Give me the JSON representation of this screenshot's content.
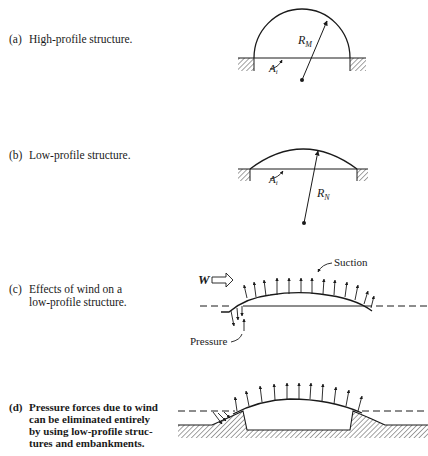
{
  "panels": [
    {
      "id": "a",
      "label": "(a)",
      "caption_lines": [
        "High-profile structure."
      ],
      "radius_label": "R",
      "radius_sub": "M",
      "area_label": "A",
      "area_sub": "i"
    },
    {
      "id": "b",
      "label": "(b)",
      "caption_lines": [
        "Low-profile structure."
      ],
      "radius_label": "R",
      "radius_sub": "N",
      "area_label": "A",
      "area_sub": "i"
    },
    {
      "id": "c",
      "label": "(c)",
      "caption_lines": [
        "Effects of wind on a",
        "low-profile structure."
      ],
      "wind_label": "W",
      "suction_label": "Suction",
      "pressure_label": "Pressure"
    },
    {
      "id": "d",
      "label": "(d)",
      "caption_lines": [
        "Pressure forces due to wind",
        "can be eliminated entirely",
        "by using low-profile struc-",
        "tures and embankments."
      ]
    }
  ],
  "colors": {
    "ink": "#1a1a1a",
    "background": "#ffffff"
  }
}
